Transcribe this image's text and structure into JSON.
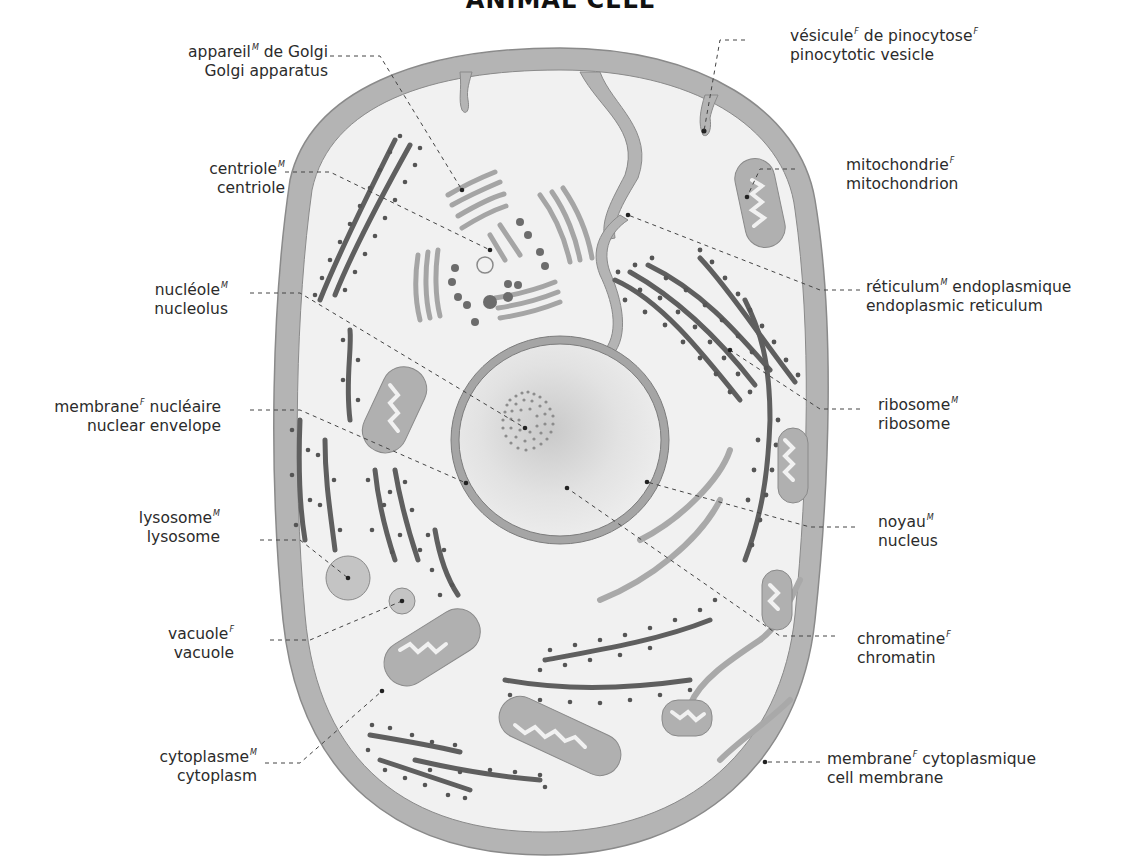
{
  "title": "ANIMAL CELL",
  "colors": {
    "membrane": "#b4b4b4",
    "cytoplasm": "#f1f1f1",
    "organelle_light": "#a9a9a9",
    "organelle_dark": "#5f5f5f",
    "ribosome": "#555555",
    "leader_line": "#444444",
    "text": "#2b2b2b"
  },
  "labels": {
    "golgi": {
      "fr": "appareil",
      "fr_gender": "M",
      "fr_rest": " de Golgi",
      "en": "Golgi apparatus"
    },
    "centriole": {
      "fr": "centriole",
      "fr_gender": "M",
      "fr_rest": "",
      "en": "centriole"
    },
    "nucleolus": {
      "fr": "nucléole",
      "fr_gender": "M",
      "fr_rest": "",
      "en": "nucleolus"
    },
    "nuclear_envelope": {
      "fr": "membrane",
      "fr_gender": "F",
      "fr_rest": " nucléaire",
      "en": "nuclear envelope"
    },
    "lysosome": {
      "fr": "lysosome",
      "fr_gender": "M",
      "fr_rest": "",
      "en": "lysosome"
    },
    "vacuole": {
      "fr": "vacuole",
      "fr_gender": "F",
      "fr_rest": "",
      "en": "vacuole"
    },
    "cytoplasm": {
      "fr": "cytoplasme",
      "fr_gender": "M",
      "fr_rest": "",
      "en": "cytoplasm"
    },
    "pinocytotic_vesicle": {
      "fr": "vésicule",
      "fr_gender": "F",
      "fr_rest": " de pinocytose",
      "fr_gender2": "F",
      "en": "pinocytotic vesicle"
    },
    "mitochondrion": {
      "fr": "mitochondrie",
      "fr_gender": "F",
      "fr_rest": "",
      "en": "mitochondrion"
    },
    "endoplasmic_reticulum": {
      "fr": "réticulum",
      "fr_gender": "M",
      "fr_rest": " endoplasmique",
      "en": "endoplasmic reticulum"
    },
    "ribosome": {
      "fr": "ribosome",
      "fr_gender": "M",
      "fr_rest": "",
      "en": "ribosome"
    },
    "nucleus": {
      "fr": "noyau",
      "fr_gender": "M",
      "fr_rest": "",
      "en": "nucleus"
    },
    "chromatin": {
      "fr": "chromatine",
      "fr_gender": "F",
      "fr_rest": "",
      "en": "chromatin"
    },
    "cell_membrane": {
      "fr": "membrane",
      "fr_gender": "F",
      "fr_rest": " cytoplasmique",
      "en": "cell membrane"
    }
  }
}
